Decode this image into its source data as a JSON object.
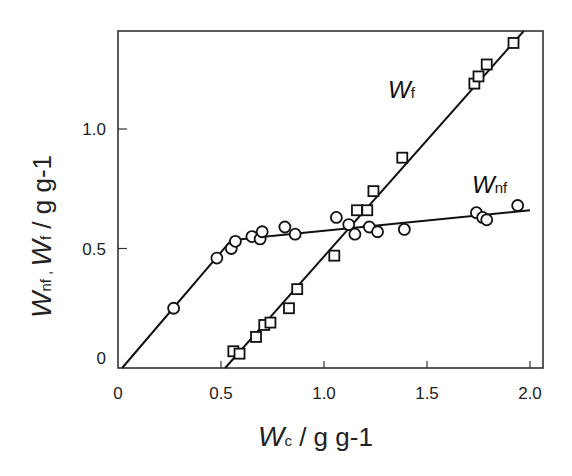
{
  "chart_data": {
    "type": "scatter",
    "title": "",
    "xlabel": "Wc / g g-1",
    "ylabel": "Wnf , Wf / g g-1",
    "xlim": [
      0,
      2.05
    ],
    "ylim": [
      0,
      1.41
    ],
    "grid": false,
    "legend": "inline labels",
    "x_ticks": [
      "0",
      "0.5",
      "1.0",
      "1.5",
      "2.0"
    ],
    "y_ticks": [
      "0",
      "0.5",
      "1.0"
    ],
    "series": [
      {
        "name": "Wnf",
        "marker": "circle",
        "points": [
          [
            0.27,
            0.25
          ],
          [
            0.48,
            0.46
          ],
          [
            0.55,
            0.5
          ],
          [
            0.57,
            0.53
          ],
          [
            0.65,
            0.55
          ],
          [
            0.69,
            0.54
          ],
          [
            0.7,
            0.57
          ],
          [
            0.81,
            0.59
          ],
          [
            0.86,
            0.56
          ],
          [
            1.06,
            0.63
          ],
          [
            1.12,
            0.6
          ],
          [
            1.15,
            0.56
          ],
          [
            1.22,
            0.59
          ],
          [
            1.26,
            0.57
          ],
          [
            1.39,
            0.58
          ],
          [
            1.74,
            0.65
          ],
          [
            1.77,
            0.63
          ],
          [
            1.79,
            0.62
          ],
          [
            1.94,
            0.68
          ]
        ],
        "fit_line": [
          [
            0.02,
            0.0
          ],
          [
            0.55,
            0.535
          ],
          [
            2.0,
            0.66
          ]
        ]
      },
      {
        "name": "Wf",
        "marker": "square",
        "points": [
          [
            0.56,
            0.07
          ],
          [
            0.59,
            0.06
          ],
          [
            0.67,
            0.13
          ],
          [
            0.71,
            0.18
          ],
          [
            0.74,
            0.19
          ],
          [
            0.83,
            0.25
          ],
          [
            0.87,
            0.33
          ],
          [
            1.05,
            0.47
          ],
          [
            1.16,
            0.66
          ],
          [
            1.21,
            0.66
          ],
          [
            1.24,
            0.74
          ],
          [
            1.38,
            0.88
          ],
          [
            1.73,
            1.19
          ],
          [
            1.75,
            1.22
          ],
          [
            1.79,
            1.27
          ],
          [
            1.92,
            1.36
          ]
        ],
        "fit_line": [
          [
            0.52,
            0.0
          ],
          [
            1.97,
            1.41
          ]
        ]
      }
    ],
    "annotations": [
      {
        "text_main": "W",
        "text_sub": "f",
        "at": [
          1.3,
          1.07
        ]
      },
      {
        "text_main": "W",
        "text_sub": "nf",
        "at": [
          1.74,
          0.74
        ]
      }
    ]
  },
  "labels": {
    "x_main": "W",
    "x_sub": "c",
    "x_unit": " / g g-1",
    "y_main1": "W",
    "y_sub1": "nf",
    "y_sep": " , ",
    "y_main2": "W",
    "y_sub2": "f",
    "y_unit": " / g g-1",
    "wf_main": "W",
    "wf_sub": "f",
    "wnf_main": "W",
    "wnf_sub": "nf"
  }
}
